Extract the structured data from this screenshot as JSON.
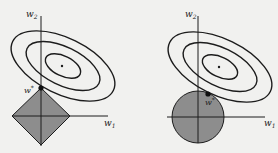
{
  "colors": {
    "background": "#f1f1ef",
    "stroke": "#1c1c1c",
    "region_fill": "#8d8d8d"
  },
  "left_panel": {
    "title": "L1 constraint (diamond)",
    "axis_x_label": "w",
    "axis_x_sub": "1",
    "axis_y_label": "w",
    "axis_y_sub": "2",
    "optimum_label": "w",
    "optimum_sup": "*",
    "constraint_shape": "diamond",
    "contour_count": 3
  },
  "right_panel": {
    "title": "L2 constraint (circle)",
    "axis_x_label": "w",
    "axis_x_sub": "1",
    "axis_y_label": "w",
    "axis_y_sub": "2",
    "optimum_label": "w",
    "optimum_sup": "*",
    "constraint_shape": "circle",
    "contour_count": 3
  }
}
